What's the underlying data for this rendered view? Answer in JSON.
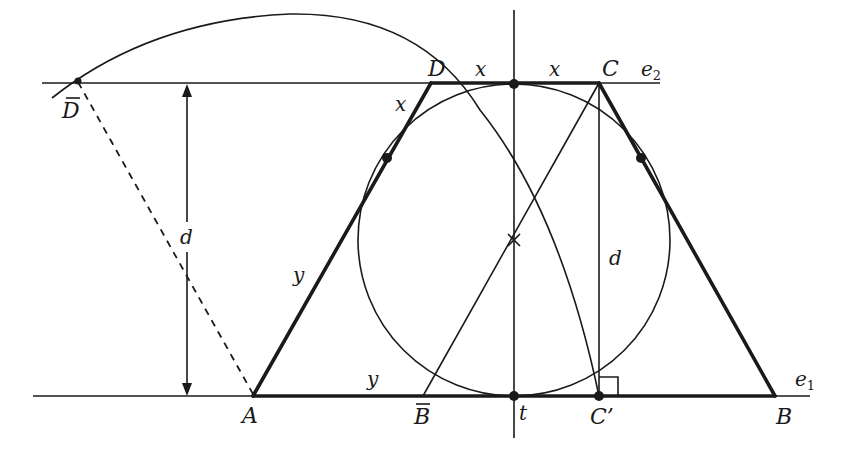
{
  "figure": {
    "labels": {
      "D_bar": "D",
      "D": "D",
      "C": "C",
      "e2": "e",
      "e2_sub": "2",
      "x_top_left": "x",
      "x_top_right": "x",
      "x_side": "x",
      "d_left": "d",
      "d_right": "d",
      "y_side": "y",
      "y_base": "y",
      "A": "A",
      "B_bar": "B",
      "t": "t",
      "C_prime": "C’",
      "B": "B",
      "e1": "e",
      "e1_sub": "1"
    },
    "colors": {
      "ink": "#1a1a1a",
      "background": "#ffffff"
    }
  }
}
